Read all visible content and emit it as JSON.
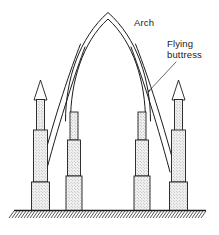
{
  "figure": {
    "type": "technical-line-drawing",
    "width": 219,
    "height": 235,
    "background_color": "#ffffff",
    "line_color": "#1c1c1c",
    "fill_pattern": "stipple",
    "fill_color": "#e8e8e8"
  },
  "labels": {
    "arch": {
      "text": "Arch",
      "x": 134,
      "y": 26
    },
    "flying_buttress_line1": {
      "text": "Flying",
      "x": 167,
      "y": 47
    },
    "flying_buttress_line2": {
      "text": "buttress",
      "x": 167,
      "y": 58
    }
  },
  "leader": {
    "from_x": 175,
    "from_y": 62,
    "to_x": 147,
    "to_y": 92,
    "arrowhead": true
  },
  "arch": {
    "name": "pointed-gothic-arch",
    "apex_x": 108,
    "apex_y": 13,
    "left_spring_x": 70,
    "right_spring_x": 146,
    "spring_y": 120,
    "thickness": 4.5
  },
  "buttresses": [
    {
      "name": "left-flying-buttress",
      "start_x": 78,
      "start_y": 52,
      "end_x": 41,
      "end_y": 172,
      "thickness": 4
    },
    {
      "name": "right-flying-buttress",
      "start_x": 138,
      "start_y": 52,
      "end_x": 178,
      "end_y": 172,
      "thickness": 4
    }
  ],
  "columns": [
    {
      "name": "left-outer-pinnacle",
      "kind": "pinnacle",
      "spire": {
        "tip_x": 40.5,
        "tip_y": 80,
        "left_x": 34,
        "right_x": 47,
        "base_y": 100
      },
      "shaft": {
        "left_x": 36.5,
        "right_x": 44.5,
        "top_y": 100,
        "bottom_y": 130
      },
      "mid": {
        "left_x": 33.5,
        "right_x": 47.5,
        "top_y": 130,
        "bottom_y": 182
      },
      "base": {
        "left_x": 31.5,
        "right_x": 49.5,
        "top_y": 182,
        "bottom_y": 210
      }
    },
    {
      "name": "left-inner-pier",
      "kind": "pier",
      "shaft": {
        "left_x": 70,
        "right_x": 78,
        "top_y": 112,
        "bottom_y": 140
      },
      "mid": {
        "left_x": 67.5,
        "right_x": 80.5,
        "top_y": 140,
        "bottom_y": 176
      },
      "base": {
        "left_x": 66,
        "right_x": 82,
        "top_y": 176,
        "bottom_y": 210
      }
    },
    {
      "name": "right-inner-pier",
      "kind": "pier",
      "shaft": {
        "left_x": 138,
        "right_x": 146,
        "top_y": 112,
        "bottom_y": 140
      },
      "mid": {
        "left_x": 135.5,
        "right_x": 148.5,
        "top_y": 140,
        "bottom_y": 176
      },
      "base": {
        "left_x": 134,
        "right_x": 150,
        "top_y": 176,
        "bottom_y": 210
      }
    },
    {
      "name": "right-outer-pinnacle",
      "kind": "pinnacle",
      "spire": {
        "tip_x": 178.5,
        "tip_y": 80,
        "left_x": 172,
        "right_x": 185,
        "base_y": 100
      },
      "shaft": {
        "left_x": 174.5,
        "right_x": 182.5,
        "top_y": 100,
        "bottom_y": 130
      },
      "mid": {
        "left_x": 171.5,
        "right_x": 185.5,
        "top_y": 130,
        "bottom_y": 182
      },
      "base": {
        "left_x": 169.5,
        "right_x": 187.5,
        "top_y": 182,
        "bottom_y": 210
      }
    }
  ],
  "ground": {
    "name": "ground-line",
    "y": 210,
    "x_start": 14,
    "x_end": 206,
    "hatch_count": 64,
    "hatch_depth": 7,
    "hatch_angle_dx": 5
  }
}
